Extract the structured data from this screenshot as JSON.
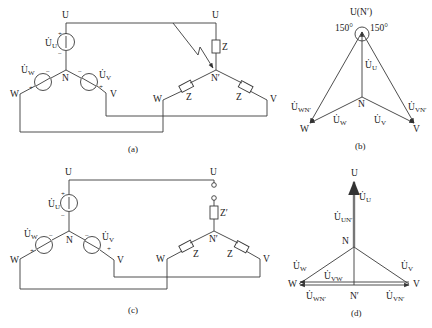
{
  "figure": {
    "a": {
      "caption": "(a)",
      "source_nodes": {
        "U": "U",
        "V": "V",
        "W": "W",
        "N": "N"
      },
      "load_nodes": {
        "U": "U",
        "V": "V",
        "W": "W",
        "N": "N′"
      },
      "sources": {
        "U": "U̇",
        "U_sub": "U",
        "V": "U̇",
        "V_sub": "V",
        "W": "U̇",
        "W_sub": "W"
      },
      "plus": "+",
      "minus": "−",
      "impedance": "Z"
    },
    "b": {
      "caption": "(b)",
      "top_label": "U(N′)",
      "angle_left": "150°",
      "angle_right": "150°",
      "N": "N",
      "W": "W",
      "V": "V",
      "phasors": {
        "U": "U̇",
        "U_sub": "U",
        "V": "U̇",
        "V_sub": "V",
        "W": "U̇",
        "W_sub": "W",
        "WN": "U̇",
        "WN_sub": "WN′",
        "VN": "U̇",
        "VN_sub": "VN′"
      }
    },
    "c": {
      "caption": "(c)",
      "source_nodes": {
        "U": "U",
        "V": "V",
        "W": "W",
        "N": "N"
      },
      "load_nodes": {
        "U": "U",
        "V": "V",
        "W": "W",
        "N": "N′"
      },
      "sources": {
        "U": "U̇",
        "U_sub": "U",
        "V": "U̇",
        "V_sub": "V",
        "W": "U̇",
        "W_sub": "W"
      },
      "plus": "+",
      "minus": "−",
      "impedance": "Z",
      "impedance_prime": "Z′"
    },
    "d": {
      "caption": "(d)",
      "U": "U",
      "N": "N",
      "Nprime": "N′",
      "W": "W",
      "V": "V",
      "phasors": {
        "U": "U̇",
        "U_sub": "U",
        "UN": "U̇",
        "UN_sub": "UN′",
        "V": "U̇",
        "V_sub": "V",
        "W": "U̇",
        "W_sub": "W",
        "VW": "U̇",
        "VW_sub": "VW",
        "WN": "U̇",
        "WN_sub": "WN′",
        "VN": "U̇",
        "VN_sub": "VN′"
      }
    }
  }
}
